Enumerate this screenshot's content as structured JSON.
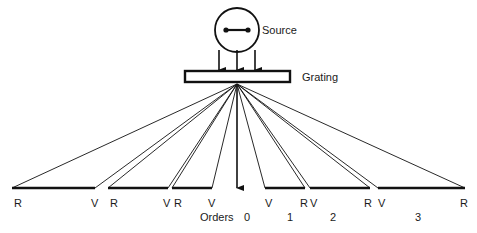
{
  "diagram": {
    "source": {
      "label": "Source",
      "label_x": 262,
      "label_y": 25,
      "circle_cx": 237,
      "circle_cy": 30,
      "circle_r": 22,
      "filament_icon": "dumbbell-filament-icon"
    },
    "grating": {
      "label": "Grating",
      "label_x": 302,
      "label_y": 72,
      "rect_x": 185,
      "rect_y": 71,
      "rect_w": 105,
      "rect_h": 11
    },
    "incident_arrows": {
      "icon": "arrow-down-icon",
      "count": 3,
      "x_positions": [
        219,
        237,
        255
      ],
      "y_start": 50,
      "y_end": 70
    },
    "zero_order_arrow": {
      "icon": "arrow-down-icon",
      "x": 237,
      "y_start": 86,
      "y_end": 188
    },
    "convergence_point": {
      "x": 237,
      "y": 84
    },
    "orders_label": "Orders",
    "orders_label_x": 200,
    "orders_label_y": 212,
    "order_numbers": [
      {
        "text": "0",
        "x": 244,
        "y": 212
      },
      {
        "text": "1",
        "x": 287,
        "y": 212
      },
      {
        "text": "2",
        "x": 330,
        "y": 212
      },
      {
        "text": "3",
        "x": 415,
        "y": 212
      }
    ],
    "spectra": [
      {
        "side": "left",
        "order": 3,
        "bar_x1": 12,
        "bar_x2": 95,
        "bar_y": 188,
        "violet_label": "V",
        "red_label": "R",
        "violet_x": 91,
        "red_x": 14,
        "label_y": 198
      },
      {
        "side": "left",
        "order": 2,
        "bar_x1": 108,
        "bar_x2": 168,
        "bar_y": 188,
        "violet_label": "V",
        "red_label": "R",
        "violet_x": 163,
        "red_x": 110,
        "label_y": 198
      },
      {
        "side": "left",
        "order": 1,
        "bar_x1": 172,
        "bar_x2": 212,
        "bar_y": 188,
        "violet_label": "V",
        "red_label": "R",
        "violet_x": 208,
        "red_x": 174,
        "label_y": 198
      },
      {
        "side": "right",
        "order": 1,
        "bar_x1": 265,
        "bar_x2": 305,
        "bar_y": 188,
        "violet_label": "V",
        "red_label": "R",
        "violet_x": 265,
        "red_x": 300,
        "label_y": 198
      },
      {
        "side": "right",
        "order": 2,
        "bar_x1": 310,
        "bar_x2": 370,
        "bar_y": 188,
        "violet_label": "V",
        "red_label": "R",
        "violet_x": 310,
        "red_x": 364,
        "label_y": 198
      },
      {
        "side": "right",
        "order": 3,
        "bar_x1": 378,
        "bar_x2": 465,
        "bar_y": 188,
        "violet_label": "V",
        "red_label": "R",
        "violet_x": 378,
        "red_x": 460,
        "label_y": 198
      }
    ],
    "colors": {
      "ink": "#1a1a1a",
      "background": "#ffffff",
      "ray_stroke": "#111111"
    }
  }
}
